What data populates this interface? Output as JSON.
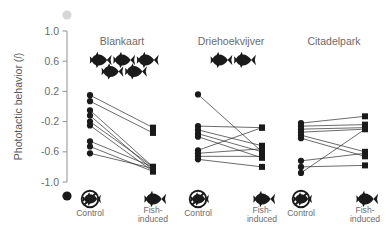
{
  "figure": {
    "ylabel": "Phototactic behavior (l)",
    "ylabel_main": "Phototactic behavior (",
    "ylabel_italic": "l",
    "ylabel_close": ")",
    "axis_top_marker": "light-circle",
    "axis_bottom_marker": "dark-circle",
    "background": "#ffffff",
    "ink": "#1a1a1a",
    "text_color": "#6b6b6b",
    "axis_color": "#9a9a9a"
  },
  "chart_data": {
    "type": "scatter",
    "title": "",
    "subtitle": "",
    "xlabel": "",
    "ylabel": "Phototactic behavior (l)",
    "ylim": [
      -1.0,
      1.0
    ],
    "yticks": [
      "1.0",
      "0.6",
      "0.2",
      "-0.2",
      "-0.6",
      "-1.0"
    ],
    "ytick_values": [
      1.0,
      0.6,
      0.2,
      -0.2,
      -0.6,
      -1.0
    ],
    "grid": false,
    "legend": "none",
    "categories": [
      "Control",
      "Fish-induced"
    ],
    "x_tick_labels": [
      {
        "label": "Control",
        "icon": "no-fish-icon"
      },
      {
        "label": "Fish-​induced",
        "line1": "Fish-",
        "line2": "induced",
        "icon": "fish-icon"
      }
    ],
    "marker_control": "circle",
    "marker_treatment": "square",
    "panels": [
      {
        "name": "Blankaart",
        "fish_count": 5,
        "fish_rows": [
          3,
          2
        ],
        "series": [
          {
            "name": "pair-1",
            "control": 0.15,
            "treatment": -0.28
          },
          {
            "name": "pair-2",
            "control": 0.07,
            "treatment": -0.35
          },
          {
            "name": "pair-3",
            "control": -0.05,
            "treatment": -0.8
          },
          {
            "name": "pair-4",
            "control": -0.12,
            "treatment": -0.84
          },
          {
            "name": "pair-5",
            "control": -0.2,
            "treatment": -0.8
          },
          {
            "name": "pair-6",
            "control": -0.25,
            "treatment": -0.86
          },
          {
            "name": "pair-7",
            "control": -0.46,
            "treatment": -0.8
          },
          {
            "name": "pair-8",
            "control": -0.53,
            "treatment": -0.86
          },
          {
            "name": "pair-9",
            "control": -0.62,
            "treatment": -0.82
          }
        ]
      },
      {
        "name": "Driehoekvijver",
        "fish_count": 2,
        "fish_rows": [
          2
        ],
        "series": [
          {
            "name": "pair-1",
            "control": 0.16,
            "treatment": -0.6
          },
          {
            "name": "pair-2",
            "control": -0.26,
            "treatment": -0.28
          },
          {
            "name": "pair-3",
            "control": -0.31,
            "treatment": -0.52
          },
          {
            "name": "pair-4",
            "control": -0.36,
            "treatment": -0.6
          },
          {
            "name": "pair-5",
            "control": -0.4,
            "treatment": -0.68
          },
          {
            "name": "pair-6",
            "control": -0.58,
            "treatment": -0.28
          },
          {
            "name": "pair-7",
            "control": -0.62,
            "treatment": -0.56
          },
          {
            "name": "pair-8",
            "control": -0.66,
            "treatment": -0.66
          },
          {
            "name": "pair-9",
            "control": -0.7,
            "treatment": -0.8
          }
        ]
      },
      {
        "name": "Citadelpark",
        "fish_count": 0,
        "fish_rows": [],
        "series": [
          {
            "name": "pair-1",
            "control": -0.22,
            "treatment": -0.13
          },
          {
            "name": "pair-2",
            "control": -0.26,
            "treatment": -0.24
          },
          {
            "name": "pair-3",
            "control": -0.3,
            "treatment": -0.28
          },
          {
            "name": "pair-4",
            "control": -0.34,
            "treatment": -0.3
          },
          {
            "name": "pair-5",
            "control": -0.38,
            "treatment": -0.6
          },
          {
            "name": "pair-6",
            "control": -0.42,
            "treatment": -0.66
          },
          {
            "name": "pair-7",
            "control": -0.72,
            "treatment": -0.62
          },
          {
            "name": "pair-8",
            "control": -0.8,
            "treatment": -0.78
          },
          {
            "name": "pair-9",
            "control": -0.88,
            "treatment": -0.3
          }
        ]
      }
    ]
  }
}
